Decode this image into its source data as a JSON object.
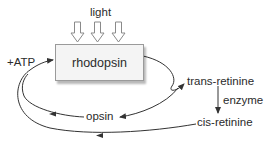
{
  "diagram": {
    "input": {
      "label": "light",
      "arrow_count": 3
    },
    "node_main": {
      "label": "rhodopsin"
    },
    "cofactor": {
      "label": "+ATP"
    },
    "products": {
      "trans": "trans-retinine",
      "cis": "cis-retinine",
      "opsin": "opsin"
    },
    "conversion": {
      "label": "enzyme"
    },
    "colors": {
      "line": "#333333",
      "box_fill": "#f4f4f4",
      "box_border": "#9a9a9a",
      "text": "#2b2b2b",
      "hollow_arrow": "#888888"
    }
  }
}
